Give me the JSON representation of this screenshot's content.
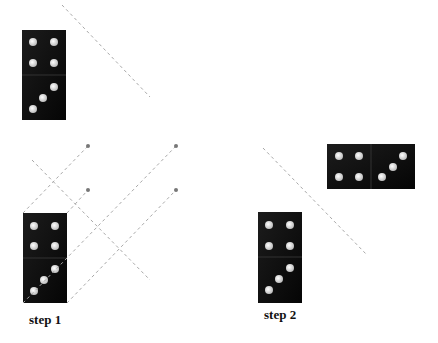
{
  "labels": {
    "step1": "step 1",
    "step2": "step 2"
  },
  "colors": {
    "domino": "#0d0d0d",
    "pip": "#e8e8e8",
    "guide": "#a8a8a8",
    "point": "#777777"
  },
  "dominoes": [
    {
      "name": "original",
      "top": 4,
      "bottom": 3,
      "orientation": "vertical"
    },
    {
      "name": "step1",
      "top": 4,
      "bottom": 3,
      "orientation": "vertical"
    },
    {
      "name": "step2",
      "top": 4,
      "bottom": 3,
      "orientation": "vertical"
    },
    {
      "name": "rotated",
      "left": 4,
      "right": 3,
      "orientation": "horizontal"
    }
  ]
}
